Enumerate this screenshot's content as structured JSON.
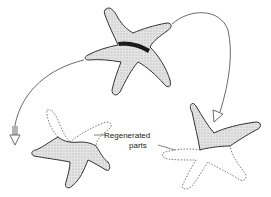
{
  "diagram": {
    "labels": {
      "regenerated_line1": "Regenerated",
      "regenerated_line2": "parts"
    },
    "colors": {
      "outline": "#333333",
      "fill": "#d8d8d8",
      "cut_band": "#1a1a1a",
      "arrow": "#444444",
      "background": "#ffffff"
    }
  }
}
